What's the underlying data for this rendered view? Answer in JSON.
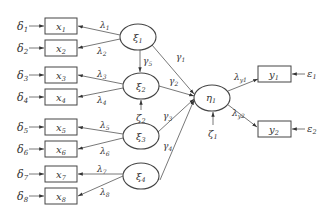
{
  "diagram": {
    "type": "structural-equation-model path diagram",
    "observed_x": [
      {
        "id": "x1",
        "label": "x",
        "sub": "1",
        "error": "δ",
        "error_sub": "1",
        "loading": "λ",
        "loading_sub": "1"
      },
      {
        "id": "x2",
        "label": "x",
        "sub": "2",
        "error": "δ",
        "error_sub": "2",
        "loading": "λ",
        "loading_sub": "2"
      },
      {
        "id": "x3",
        "label": "x",
        "sub": "3",
        "error": "δ",
        "error_sub": "3",
        "loading": "λ",
        "loading_sub": "3"
      },
      {
        "id": "x4",
        "label": "x",
        "sub": "4",
        "error": "δ",
        "error_sub": "4",
        "loading": "λ",
        "loading_sub": "4"
      },
      {
        "id": "x5",
        "label": "x",
        "sub": "5",
        "error": "δ",
        "error_sub": "5",
        "loading": "λ",
        "loading_sub": "5"
      },
      {
        "id": "x6",
        "label": "x",
        "sub": "6",
        "error": "δ",
        "error_sub": "6",
        "loading": "λ",
        "loading_sub": "6"
      },
      {
        "id": "x7",
        "label": "x",
        "sub": "7",
        "error": "δ",
        "error_sub": "7",
        "loading": "λ",
        "loading_sub": "7"
      },
      {
        "id": "x8",
        "label": "x",
        "sub": "8",
        "error": "δ",
        "error_sub": "8",
        "loading": "λ",
        "loading_sub": "8"
      }
    ],
    "latent_xi": [
      {
        "id": "xi1",
        "label": "ξ",
        "sub": "1"
      },
      {
        "id": "xi2",
        "label": "ξ",
        "sub": "2",
        "disturbance": "ζ",
        "disturbance_sub": "2"
      },
      {
        "id": "xi3",
        "label": "ξ",
        "sub": "3"
      },
      {
        "id": "xi4",
        "label": "ξ",
        "sub": "4"
      }
    ],
    "latent_eta": {
      "id": "eta1",
      "label": "η",
      "sub": "1",
      "disturbance": "ζ",
      "disturbance_sub": "1"
    },
    "paths_gamma": [
      {
        "label": "γ",
        "sub": "1",
        "from": "xi1",
        "to": "eta1"
      },
      {
        "label": "γ",
        "sub": "2",
        "from": "xi2",
        "to": "eta1"
      },
      {
        "label": "γ",
        "sub": "3",
        "from": "xi3",
        "to": "eta1"
      },
      {
        "label": "γ",
        "sub": "4",
        "from": "xi4",
        "to": "eta1"
      },
      {
        "label": "γ",
        "sub": "5",
        "from": "xi1",
        "to": "xi2"
      }
    ],
    "observed_y": [
      {
        "id": "y1",
        "label": "y",
        "sub": "1",
        "error": "ε",
        "error_sub": "1",
        "loading": "λ",
        "loading_sub": "y1"
      },
      {
        "id": "y2",
        "label": "y",
        "sub": "2",
        "error": "ε",
        "error_sub": "2",
        "loading": "λ",
        "loading_sub": "y2"
      }
    ]
  }
}
